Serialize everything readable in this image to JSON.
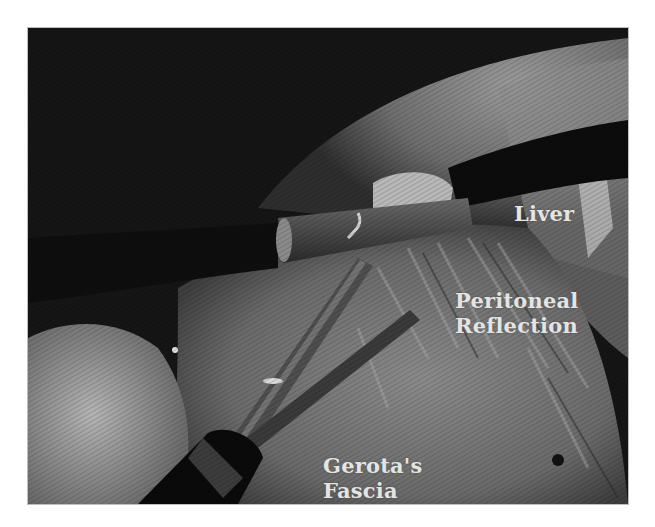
{
  "figure": {
    "type": "laparoscopic-photograph",
    "colorspace": "grayscale",
    "labels": {
      "liver": "Liver",
      "peritoneal_line1": "Peritoneal",
      "peritoneal_line2": "Reflection",
      "gerota_line1": "Gerota's",
      "gerota_line2": "Fascia"
    },
    "label_color": "#e4e4e4",
    "background_color": "#ffffff"
  }
}
